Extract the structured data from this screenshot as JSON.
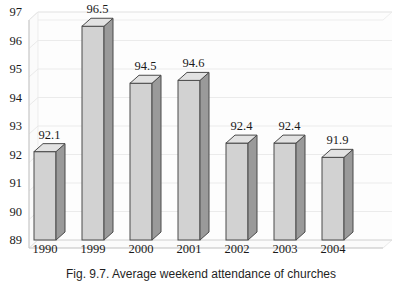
{
  "caption": "Fig. 9.7. Average weekend attendance of churches",
  "chart_data": {
    "type": "bar",
    "title": "",
    "subtitle": "",
    "xlabel": "",
    "ylabel": "",
    "categories": [
      "1990",
      "1999",
      "2000",
      "2001",
      "2002",
      "2003",
      "2004"
    ],
    "values": [
      92.1,
      96.5,
      94.5,
      94.6,
      92.4,
      92.4,
      91.9
    ],
    "value_labels": [
      "92.1",
      "96.5",
      "94.5",
      "94.6",
      "92.4",
      "92.4",
      "91.9"
    ],
    "ylim": [
      89,
      97
    ],
    "ytick_step": 1,
    "yticks": [
      97,
      96,
      95,
      94,
      93,
      92,
      91,
      90,
      89
    ],
    "ytick_labels": [
      "97",
      "96",
      "95",
      "94",
      "93",
      "92",
      "91",
      "90",
      "89"
    ],
    "grid": "horizontal",
    "legend": "none",
    "style": "3d-column",
    "series": [
      {
        "name": "Average weekend attendance",
        "values": [
          92.1,
          96.5,
          94.5,
          94.6,
          92.4,
          92.4,
          91.9
        ]
      }
    ]
  },
  "colors": {
    "bar_front": "#d2d2d2",
    "bar_side": "#9a9a9a",
    "bar_top": "#e2e2e2",
    "bar_outline": "#4a4a4a",
    "grid": "#e4e4e4",
    "wall": "#fcfcfc",
    "floor": "#fbfbfb",
    "axis": "#bdbdbd",
    "text": "#1a1a1a"
  }
}
